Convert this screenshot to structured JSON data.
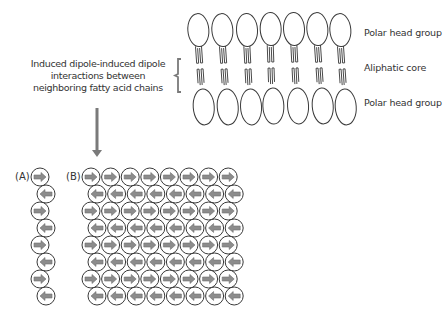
{
  "caption": {
    "line1": "Induced dipole-induced dipole",
    "line2": "interactions between",
    "line3": "neighboring fatty acid chains"
  },
  "bilayer": {
    "molecule_count": 7,
    "labels": {
      "top": "Polar head group",
      "middle": "Aliphatic core",
      "bottom": "Polar head group"
    }
  },
  "panels": {
    "a": {
      "label": "(A)",
      "rows": 8,
      "columns": 1,
      "pattern": [
        "right",
        "left",
        "right",
        "left",
        "right",
        "left",
        "right",
        "left"
      ]
    },
    "b": {
      "label": "(B)",
      "rows": 8,
      "columns": 8,
      "pattern": [
        "right",
        "left",
        "right",
        "left",
        "right",
        "left",
        "right",
        "left"
      ]
    }
  },
  "colors": {
    "line": "#3a3a3a",
    "arrow_fill": "#8a8a8a",
    "down_arrow": "#7a7a7a"
  }
}
